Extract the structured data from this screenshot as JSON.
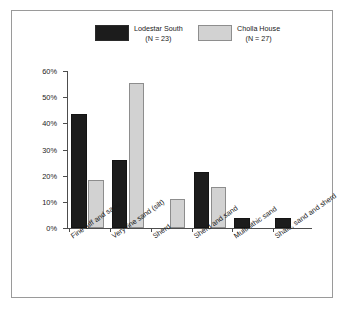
{
  "chart_data": {
    "type": "bar",
    "title": "",
    "xlabel": "",
    "ylabel": "",
    "ylim": [
      0,
      60
    ],
    "ytick_labels": [
      "0%",
      "10%",
      "20%",
      "30%",
      "40%",
      "50%",
      "60%"
    ],
    "ytick_values": [
      0,
      10,
      20,
      30,
      40,
      50,
      60
    ],
    "grid": false,
    "legend_position": "top",
    "categories": [
      "Fine tuff and sand",
      "Very fine sand (silt)",
      "Sherd",
      "Sherd and sand",
      "Multi-lithic sand",
      "Shale, sand and sherd"
    ],
    "series": [
      {
        "name": "Lodestar South",
        "n_label": "(N = 23)",
        "color": "#1c1c1c",
        "values": [
          43.5,
          26.0,
          0,
          21.5,
          4.0,
          4.0
        ]
      },
      {
        "name": "Cholla House",
        "n_label": "(N = 27)",
        "color": "#d2d2d2",
        "values": [
          18.5,
          55.5,
          11.0,
          15.5,
          0,
          0
        ]
      }
    ]
  },
  "legend": {
    "entries": [
      {
        "label": "Lodestar South",
        "sub": "(N = 23)"
      },
      {
        "label": "Cholla House",
        "sub": "(N = 27)"
      }
    ]
  }
}
